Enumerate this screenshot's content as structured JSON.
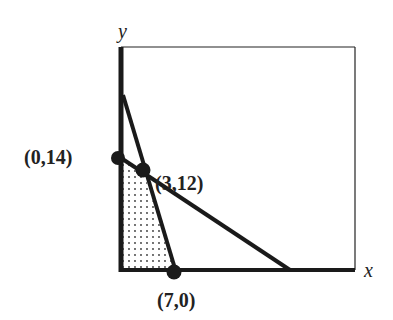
{
  "diagram": {
    "axes": {
      "x_label": "x",
      "y_label": "y"
    },
    "points": [
      {
        "id": "p1",
        "label": "(0,14)",
        "x": 0,
        "y": 14
      },
      {
        "id": "p2",
        "label": "(3,12)",
        "x": 3,
        "y": 12
      },
      {
        "id": "p3",
        "label": "(7,0)",
        "x": 7,
        "y": 0
      }
    ],
    "lines": [
      {
        "id": "steep-line",
        "description": "steep constraint line through (3,12) and (7,0)"
      },
      {
        "id": "shallow-line",
        "description": "shallow constraint line through (0,14) and (3,12)"
      }
    ],
    "feasible_region": {
      "vertices": [
        "(0,0)",
        "(0,14)",
        "(3,12)",
        "(7,0)"
      ],
      "fill": "dotted"
    },
    "colors": {
      "ink": "#1a1a1a",
      "background": "#ffffff"
    }
  }
}
